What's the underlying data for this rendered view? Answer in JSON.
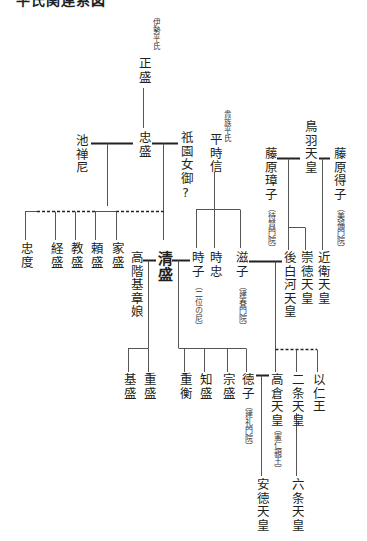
{
  "title": "平氏関連系図",
  "clan_labels": {
    "ise_heishi": "伊勢平氏",
    "kizoku_heishi": "貴族平氏"
  },
  "people": {
    "masamori": {
      "name": "正盛"
    },
    "tadamori": {
      "name": "忠盛"
    },
    "ikenozenni": {
      "name": "池禅尼"
    },
    "gion_nyogo": {
      "name": "祇園女御?"
    },
    "tokinobu": {
      "name": "平時信"
    },
    "toba": {
      "name": "鳥羽天皇"
    },
    "shoshi": {
      "name": "藤原璋子",
      "note": "（待賢門院）"
    },
    "tokushi": {
      "name": "藤原得子",
      "note": "（美福門院）"
    },
    "tadanori": {
      "name": "忠度"
    },
    "tsunemori": {
      "name": "経盛"
    },
    "norimori": {
      "name": "教盛"
    },
    "yorimori": {
      "name": "頼盛"
    },
    "iemori": {
      "name": "家盛"
    },
    "kiyomori": {
      "name": "清盛"
    },
    "takashina": {
      "name": "高階基章娘"
    },
    "tokiko": {
      "name": "時子",
      "note": "（二位の尼）"
    },
    "tokitada": {
      "name": "時忠"
    },
    "shigeko": {
      "name": "滋子",
      "note": "（建春門院）"
    },
    "goshirakawa": {
      "name": "後白河天皇"
    },
    "sutoku": {
      "name": "崇徳天皇"
    },
    "konoe": {
      "name": "近衛天皇"
    },
    "motomori": {
      "name": "基盛"
    },
    "shigemori": {
      "name": "重盛"
    },
    "shigehira": {
      "name": "重衡"
    },
    "tomomori": {
      "name": "知盛"
    },
    "munemori": {
      "name": "宗盛"
    },
    "tokuko": {
      "name": "徳子",
      "note": "（建礼門院）"
    },
    "takakura": {
      "name": "高倉天皇",
      "note": "（憲仁親王）"
    },
    "nijo": {
      "name": "二条天皇"
    },
    "mochihito": {
      "name": "以仁王"
    },
    "antoku": {
      "name": "安徳天皇"
    },
    "rokujo": {
      "name": "六条天皇"
    }
  },
  "legend": {
    "solid_line": "parent-child / marriage",
    "dashed_line": "sibling group (omitted links)"
  }
}
